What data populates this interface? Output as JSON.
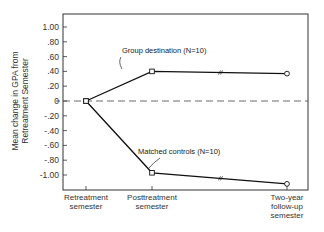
{
  "chart_data": {
    "type": "line",
    "title": "",
    "xlabel": "",
    "ylabel": "Mean change in GPA from Retreatment Semester",
    "ylabel_lines": [
      "Mean change in GPA from",
      "Retreatment Semester"
    ],
    "categories": [
      "Retreatment semester",
      "Posttreatment semester",
      "Two-year follow-up semester"
    ],
    "category_lines": [
      [
        "Retreatment",
        "semester"
      ],
      [
        "Posttreatment",
        "semester"
      ],
      [
        "Two-year",
        "follow-up",
        "semester"
      ]
    ],
    "ylim": [
      -1.2,
      1.2
    ],
    "yticks": [
      1.0,
      0.8,
      0.6,
      0.4,
      0.2,
      0,
      -0.2,
      -0.4,
      -0.6,
      -0.8,
      -1.0
    ],
    "ytick_labels": [
      "1.00",
      ".80",
      ".60",
      ".40",
      ".20",
      "0",
      "-.20",
      "-.40",
      "-.60",
      "-.80",
      "-1.00"
    ],
    "grid": false,
    "reference_line": {
      "y": 0,
      "style": "dashed"
    },
    "series": [
      {
        "name": "Group destination (N=10)",
        "values": [
          0,
          0.4,
          0.37
        ]
      },
      {
        "name": "Matched controls (N=10)",
        "values": [
          0,
          -0.97,
          -1.12
        ]
      }
    ],
    "annotations": [
      {
        "text": "Group destination (N=10)",
        "series": 0
      },
      {
        "text": "Matched controls (N=10)",
        "series": 1
      }
    ],
    "legend": "inline annotations"
  }
}
